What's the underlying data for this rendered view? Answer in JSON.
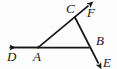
{
  "figure": {
    "type": "geometry-diagram",
    "width": 117,
    "height": 69,
    "background_color": "#fdfdfd",
    "stroke_color": "#161616",
    "label_color": "#161616"
  },
  "points": {
    "A": {
      "label": "A",
      "x": 38,
      "y": 48
    },
    "B": {
      "label": "B",
      "x": 88,
      "y": 48
    },
    "C": {
      "label": "C",
      "x": 75,
      "y": 17
    },
    "D": {
      "label": "D",
      "x": 5,
      "y": 47
    },
    "E": {
      "label": "E",
      "x": 102,
      "y": 67
    },
    "F": {
      "label": "F",
      "x": 93,
      "y": 2
    }
  },
  "segments": [
    {
      "name": "ray-A-to-D",
      "from": "A",
      "to": "D",
      "arrow_at": "D"
    },
    {
      "name": "segment-A-to-B",
      "from": "A",
      "to": "B",
      "arrow_at": "none"
    },
    {
      "name": "ray-A-through-C-to-F",
      "from": "A",
      "to": "F",
      "arrow_at": "F"
    },
    {
      "name": "ray-C-through-B-to-E",
      "from": "C",
      "to": "E",
      "arrow_at": "E"
    }
  ],
  "labels": [
    {
      "name": "label-C",
      "text": "C"
    },
    {
      "name": "label-F",
      "text": "F"
    },
    {
      "name": "label-B",
      "text": "B"
    },
    {
      "name": "label-A",
      "text": "A"
    },
    {
      "name": "label-D",
      "text": "D"
    },
    {
      "name": "label-E",
      "text": "E"
    }
  ]
}
